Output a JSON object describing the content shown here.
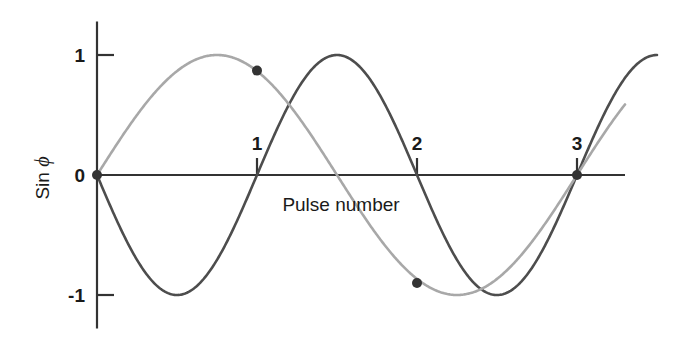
{
  "chart_data": {
    "type": "line",
    "title": "",
    "xlabel": "Pulse number",
    "ylabel": "Sin ϕ",
    "ylabel_prefix": "Sin ",
    "ylabel_symbol": "ϕ",
    "xlim": [
      -0.08,
      3.56
    ],
    "ylim": [
      -1.28,
      1.28
    ],
    "xticks": [
      1,
      2,
      3
    ],
    "xtick_labels": [
      "1",
      "2",
      "3"
    ],
    "yticks": [
      1,
      0,
      -1
    ],
    "ytick_labels": [
      "1",
      "0",
      "-1"
    ],
    "grid": false,
    "legend": "none",
    "series": [
      {
        "name": "period-2-pulse wave",
        "color": "#4d4d4d",
        "linewidth": 2.6,
        "formula": "-sin(2*pi*x/2)",
        "period_pulses": 2,
        "amplitude": 1,
        "phase": "starts at 0 descending",
        "x": [
          0.0,
          0.1,
          0.2,
          0.3,
          0.4,
          0.5,
          0.6,
          0.7,
          0.8,
          0.9,
          1.0,
          1.1,
          1.2,
          1.3,
          1.4,
          1.5,
          1.6,
          1.7,
          1.8,
          1.9,
          2.0,
          2.1,
          2.2,
          2.3,
          2.4,
          2.5,
          2.6,
          2.7,
          2.8,
          2.9,
          3.0,
          3.1,
          3.2,
          3.3,
          3.4,
          3.5
        ],
        "y": [
          0.0,
          -0.309,
          -0.588,
          -0.809,
          -0.951,
          -1.0,
          -0.951,
          -0.809,
          -0.588,
          -0.309,
          0.0,
          0.309,
          0.588,
          0.809,
          0.951,
          1.0,
          0.951,
          0.809,
          0.588,
          0.309,
          0.0,
          -0.309,
          -0.588,
          -0.809,
          -0.951,
          -1.0,
          -0.951,
          -0.809,
          -0.588,
          -0.309,
          0.0,
          0.309,
          0.588,
          0.809,
          0.951,
          1.0
        ]
      },
      {
        "name": "period-3-pulse wave",
        "color": "#a8a8a8",
        "linewidth": 2.6,
        "formula": "sin(2*pi*x/3)",
        "period_pulses": 3,
        "amplitude": 1,
        "phase": "starts at 0 ascending",
        "x": [
          0.0,
          0.1,
          0.2,
          0.3,
          0.4,
          0.5,
          0.6,
          0.7,
          0.8,
          0.9,
          1.0,
          1.1,
          1.2,
          1.3,
          1.4,
          1.5,
          1.6,
          1.7,
          1.8,
          1.9,
          2.0,
          2.1,
          2.2,
          2.3,
          2.4,
          2.5,
          2.6,
          2.7,
          2.8,
          2.9,
          3.0,
          3.1,
          3.2,
          3.3
        ],
        "y": [
          0.0,
          0.208,
          0.407,
          0.588,
          0.743,
          0.866,
          0.951,
          0.995,
          0.995,
          0.951,
          0.866,
          0.743,
          0.588,
          0.407,
          0.208,
          0.0,
          -0.208,
          -0.407,
          -0.588,
          -0.743,
          -0.866,
          -0.951,
          -0.995,
          -0.995,
          -0.951,
          -0.866,
          -0.743,
          -0.588,
          -0.407,
          -0.208,
          0.0,
          0.208,
          0.407,
          0.588
        ]
      }
    ],
    "markers": [
      {
        "label": "origin",
        "x": 0.0,
        "y": 0.0
      },
      {
        "label": "coincidence at pulse 1",
        "x": 1.0,
        "y": 0.87
      },
      {
        "label": "coincidence at pulse 2",
        "x": 2.0,
        "y": -0.9
      },
      {
        "label": "coincidence at pulse 3",
        "x": 3.0,
        "y": 0.0
      }
    ],
    "marker_color": "#333333",
    "marker_radius": 5.0,
    "axis_color": "#333333"
  }
}
